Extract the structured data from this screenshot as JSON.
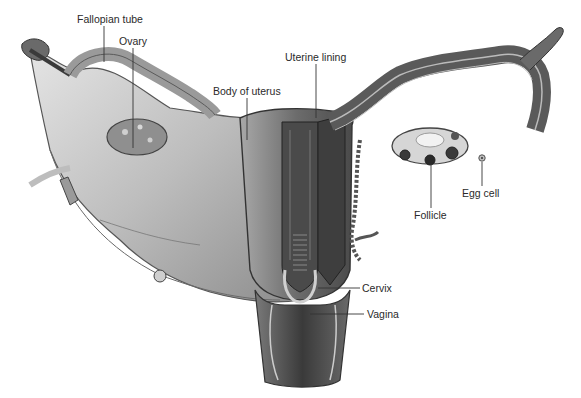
{
  "diagram": {
    "labels": [
      {
        "id": "fallopian-tube",
        "text": "Fallopian tube",
        "x": 77,
        "y": 13
      },
      {
        "id": "ovary",
        "text": "Ovary",
        "x": 119,
        "y": 35
      },
      {
        "id": "body-of-uterus",
        "text": "Body of uterus",
        "x": 213,
        "y": 85
      },
      {
        "id": "uterine-lining",
        "text": "Uterine lining",
        "x": 285,
        "y": 51
      },
      {
        "id": "egg-cell",
        "text": "Egg cell",
        "x": 462,
        "y": 187
      },
      {
        "id": "follicle",
        "text": "Follicle",
        "x": 414,
        "y": 209
      },
      {
        "id": "cervix",
        "text": "Cervix",
        "x": 362,
        "y": 282
      },
      {
        "id": "vagina",
        "text": "Vagina",
        "x": 367,
        "y": 308
      }
    ],
    "colors": {
      "background": "#ffffff",
      "label_text": "#2a2a2a",
      "leader_line": "#333333",
      "tissue_light": "#c8c8c8",
      "tissue_mid": "#8a8a8a",
      "tissue_dark": "#3c3c3c"
    }
  }
}
